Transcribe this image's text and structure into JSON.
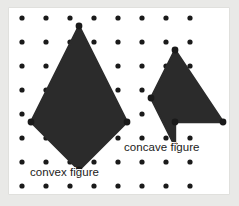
{
  "figure": {
    "kind": "geoboard-diagram",
    "canvas": {
      "width": 239,
      "height": 206
    },
    "outer_background_color": "#e9e9e7",
    "panel": {
      "x": 9,
      "y": 8,
      "width": 220,
      "height": 186,
      "background_color": "#ffffff"
    },
    "shape_fill_color": "#2b2b2b",
    "peg_color": "#1a1a1a",
    "label_color": "#1b1b1b"
  },
  "grid": {
    "name": "peg-grid",
    "origin_x": 13,
    "origin_y": 10,
    "spacing": 24,
    "columns": 8,
    "rows": 8,
    "peg_radius": 2.6
  },
  "labels": {
    "convex": "convex figure",
    "concave": "concave figure"
  },
  "shapes": [
    {
      "name": "convex-kite",
      "label_key": "convex",
      "classification": "convex",
      "vertex_grid_points": [
        [
          2,
          0
        ],
        [
          0,
          4
        ],
        [
          2,
          6
        ],
        [
          4,
          4
        ]
      ],
      "vertex_pixels": [
        [
          70,
          18
        ],
        [
          22,
          114
        ],
        [
          70,
          162
        ],
        [
          118,
          114
        ]
      ],
      "points": "70,18 22,114 70,162 118,114",
      "vertex_count": 4
    },
    {
      "name": "concave-arrow",
      "label_key": "concave",
      "classification": "concave",
      "vertex_grid_points": [
        [
          6,
          1
        ],
        [
          8,
          4
        ],
        [
          6,
          4
        ],
        [
          6,
          6
        ],
        [
          4,
          4
        ]
      ],
      "vertex_pixels": [
        [
          166,
          42
        ],
        [
          214,
          114
        ],
        [
          166,
          114
        ],
        [
          166,
          138
        ],
        [
          142,
          90
        ]
      ],
      "points": "166,42 214,114 166,114 166,138 142,90",
      "vertex_count": 5
    }
  ],
  "chart_data": {
    "type": "scatter",
    "title": "",
    "xlabel": "",
    "ylabel": "",
    "grid": true,
    "xlim": [
      0,
      7
    ],
    "ylim": [
      0,
      7
    ],
    "series": [
      {
        "name": "peg-grid",
        "x": [
          0,
          1,
          2,
          3,
          4,
          5,
          6,
          7,
          0,
          1,
          2,
          3,
          4,
          5,
          6,
          7,
          0,
          1,
          2,
          3,
          4,
          5,
          6,
          7,
          0,
          1,
          2,
          3,
          4,
          5,
          6,
          7,
          0,
          1,
          2,
          3,
          4,
          5,
          6,
          7,
          0,
          1,
          2,
          3,
          4,
          5,
          6,
          7,
          0,
          1,
          2,
          3,
          4,
          5,
          6,
          7,
          0,
          1,
          2,
          3,
          4,
          5,
          6,
          7
        ],
        "y": [
          0,
          0,
          0,
          0,
          0,
          0,
          0,
          0,
          1,
          1,
          1,
          1,
          1,
          1,
          1,
          1,
          2,
          2,
          2,
          2,
          2,
          2,
          2,
          2,
          3,
          3,
          3,
          3,
          3,
          3,
          3,
          3,
          4,
          4,
          4,
          4,
          4,
          4,
          4,
          4,
          5,
          5,
          5,
          5,
          5,
          5,
          5,
          5,
          6,
          6,
          6,
          6,
          6,
          6,
          6,
          6,
          7,
          7,
          7,
          7,
          7,
          7,
          7,
          7
        ]
      }
    ],
    "annotations": [
      {
        "text": "convex figure",
        "x": 1.0,
        "y": 6.5
      },
      {
        "text": "concave figure",
        "x": 4.7,
        "y": 5.6
      }
    ]
  }
}
